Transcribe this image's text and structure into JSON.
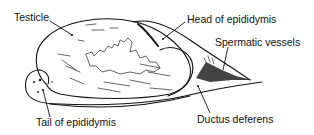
{
  "diagram": {
    "type": "anatomical-line-drawing",
    "labels": [
      {
        "id": "testicle",
        "text": "Testicle"
      },
      {
        "id": "head-epididymis",
        "text": "Head of epididymis"
      },
      {
        "id": "spermatic-vessels",
        "text": "Spermatic vessels"
      },
      {
        "id": "tail-epididymis",
        "text": "Tail of epididymis"
      },
      {
        "id": "ductus-deferens",
        "text": "Ductus deferens"
      }
    ],
    "colors": {
      "background": "#ffffff",
      "ink": "#111111"
    }
  }
}
